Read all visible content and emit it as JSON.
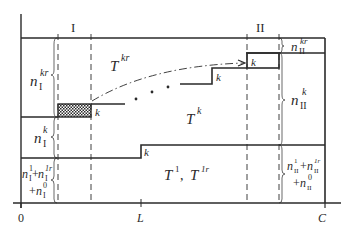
{
  "diagram": {
    "axis": {
      "origin_label": "0",
      "mid_label": "L",
      "end_label": "C"
    },
    "regions": {
      "left_label": "I",
      "right_label": "II"
    },
    "areas": {
      "top": {
        "main": "T",
        "sup": "kr"
      },
      "middle": {
        "main": "T",
        "sup": "k"
      },
      "bottom": {
        "text_a": "T",
        "sup_a": "1",
        "sep": ",",
        "text_b": "T",
        "sup_b": "1r"
      }
    },
    "left_braces": {
      "top": {
        "main": "n",
        "sub": "I",
        "sup": "kr"
      },
      "middle": {
        "main": "n",
        "sub": "I",
        "sup": "k"
      },
      "bottom": {
        "line1_a": "n",
        "line1_a_sub": "I",
        "line1_a_sup": "1",
        "plus1": "+",
        "line1_b": "n",
        "line1_b_sub": "I",
        "line1_b_sup": "1r",
        "plus2": "+",
        "line2": "n",
        "line2_sub": "I",
        "line2_sup": "0"
      }
    },
    "right_braces": {
      "top": {
        "main": "n",
        "sub": "II",
        "sup": "kr"
      },
      "middle": {
        "main": "n",
        "sub": "II",
        "sup": "k"
      },
      "bottom": {
        "line1_a": "n",
        "line1_a_sub": "II",
        "line1_a_sup": "1",
        "plus1": "+",
        "line1_b": "n",
        "line1_b_sub": "II",
        "line1_b_sup": "1r",
        "plus2": "+",
        "line2": "n",
        "line2_sub": "II",
        "line2_sup": "0"
      }
    },
    "step_labels": [
      "k",
      "k",
      "k",
      "k",
      "k"
    ],
    "ellipsis": "• • •"
  }
}
